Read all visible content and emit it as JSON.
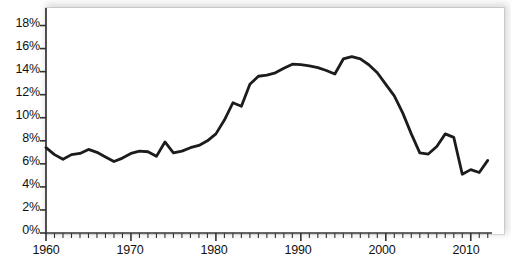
{
  "chart_data": {
    "type": "line",
    "title": "",
    "subtitle": "",
    "xlabel": "",
    "ylabel": "",
    "xlim": [
      1960,
      2012.5
    ],
    "ylim": [
      0,
      19
    ],
    "grid": false,
    "legend": null,
    "y_tick_labels": [
      "0%",
      "2%",
      "4%",
      "6%",
      "8%",
      "10%",
      "12%",
      "14%",
      "16%",
      "18%"
    ],
    "y_ticks": [
      0,
      2,
      4,
      6,
      8,
      10,
      12,
      14,
      16,
      18
    ],
    "x_tick_labels": [
      "1960",
      "1970",
      "1980",
      "1990",
      "2000",
      "2010"
    ],
    "x_major_ticks": [
      1960,
      1970,
      1980,
      1990,
      2000,
      2010
    ],
    "x_minor_tick_interval": 1,
    "value_suffix": "%",
    "series": [
      {
        "name": "series-1",
        "color": "#1c1c1c",
        "line_width": 2.8,
        "x": [
          1960,
          1961,
          1962,
          1963,
          1964,
          1965,
          1966,
          1967,
          1968,
          1969,
          1970,
          1971,
          1972,
          1973,
          1974,
          1975,
          1976,
          1977,
          1978,
          1979,
          1980,
          1981,
          1982,
          1983,
          1984,
          1985,
          1986,
          1987,
          1988,
          1989,
          1990,
          1991,
          1992,
          1993,
          1994,
          1995,
          1996,
          1997,
          1998,
          1999,
          2000,
          2001,
          2002,
          2003,
          2004,
          2005,
          2006,
          2007,
          2008,
          2009,
          2010,
          2011,
          2012
        ],
        "values": [
          7.4,
          6.8,
          6.4,
          6.8,
          6.9,
          7.25,
          7.0,
          6.6,
          6.2,
          6.5,
          6.9,
          7.1,
          7.05,
          6.65,
          7.9,
          6.95,
          7.1,
          7.4,
          7.6,
          8.0,
          8.6,
          9.8,
          11.3,
          11.0,
          12.9,
          13.6,
          13.7,
          13.9,
          14.3,
          14.65,
          14.6,
          14.5,
          14.35,
          14.1,
          13.8,
          15.1,
          15.3,
          15.1,
          14.6,
          13.9,
          12.9,
          11.9,
          10.4,
          8.6,
          6.95,
          6.85,
          7.5,
          8.6,
          8.3,
          5.1,
          5.5,
          5.25,
          6.3
        ]
      }
    ]
  }
}
